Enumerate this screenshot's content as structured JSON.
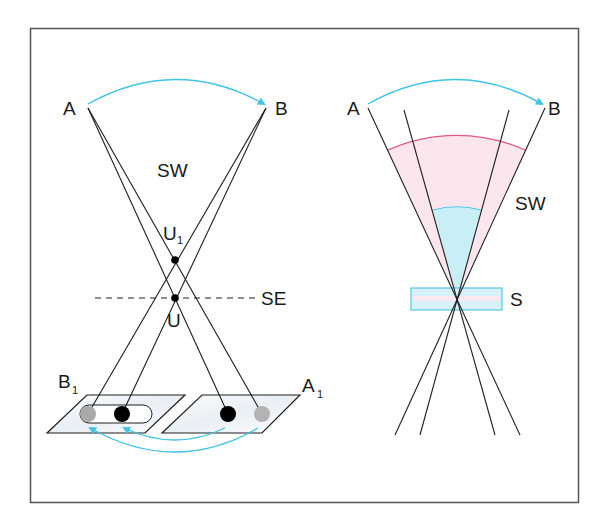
{
  "colors": {
    "frame": "#555555",
    "line": "#1e1e1e",
    "arrow": "#3fc3e6",
    "pink_line": "#e0587e",
    "pink_fill": "#fbe6ee",
    "cyan_fill": "#c9eff6",
    "cyan_line": "#58c8e0",
    "dot_black": "#000000",
    "dot_gray": "#a9a9a9"
  },
  "left_panel": {
    "label_A": "A",
    "label_B": "B",
    "label_SW": "SW",
    "label_U1_main": "U",
    "label_U1_sub": "1",
    "label_U": "U",
    "label_SE": "SE",
    "label_B1_main": "B",
    "label_B1_sub": "1",
    "label_A1_main": "A",
    "label_A1_sub": "1"
  },
  "right_panel": {
    "label_A": "A",
    "label_B": "B",
    "label_SW": "SW",
    "label_S": "S"
  }
}
